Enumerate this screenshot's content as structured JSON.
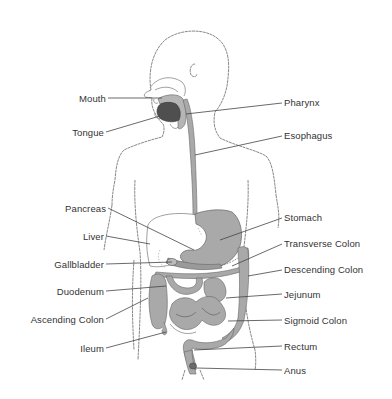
{
  "diagram": {
    "colors": {
      "organ_fill": "#a9a9a9",
      "tongue_fill": "#555555",
      "outline": "#6e6e6e",
      "leader_line": "#444444",
      "text": "#333333"
    },
    "labels_left": [
      {
        "id": "mouth",
        "text": "Mouth"
      },
      {
        "id": "tongue",
        "text": "Tongue"
      },
      {
        "id": "pancreas",
        "text": "Pancreas"
      },
      {
        "id": "liver",
        "text": "Liver"
      },
      {
        "id": "gallbladder",
        "text": "Gallbladder"
      },
      {
        "id": "duodenum",
        "text": "Duodenum"
      },
      {
        "id": "ascending_colon",
        "text": "Ascending Colon"
      },
      {
        "id": "ileum",
        "text": "Ileum"
      }
    ],
    "labels_right": [
      {
        "id": "pharynx",
        "text": "Pharynx"
      },
      {
        "id": "esophagus",
        "text": "Esophagus"
      },
      {
        "id": "stomach",
        "text": "Stomach"
      },
      {
        "id": "transverse_colon",
        "text": "Transverse Colon"
      },
      {
        "id": "descending_colon",
        "text": "Descending Colon"
      },
      {
        "id": "jejunum",
        "text": "Jejunum"
      },
      {
        "id": "sigmoid_colon",
        "text": "Sigmoid Colon"
      },
      {
        "id": "rectum",
        "text": "Rectum"
      },
      {
        "id": "anus",
        "text": "Anus"
      }
    ]
  }
}
